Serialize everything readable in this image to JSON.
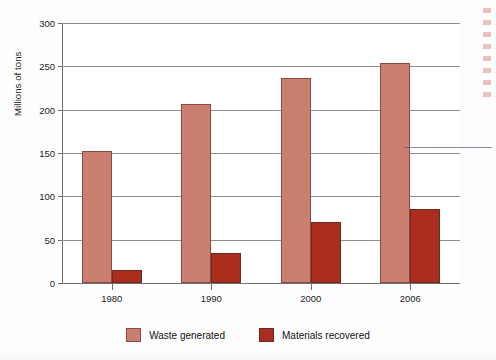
{
  "figure": {
    "background_color": "#fdfdfd",
    "plot_background_color": "#ffffff"
  },
  "axis": {
    "y_title": "Millions of tons",
    "y_ticks": [
      "0",
      "50",
      "100",
      "150",
      "200",
      "250",
      "300"
    ],
    "x_ticks": [
      "1980",
      "1990",
      "2000",
      "2006"
    ]
  },
  "legend": {
    "items": [
      {
        "label": "Waste generated",
        "color": "#cb7f71",
        "swatch_name": "legend-swatch-waste-generated"
      },
      {
        "label": "Materials recovered",
        "color": "#ab2d1d",
        "swatch_name": "legend-swatch-materials-recovered"
      }
    ]
  },
  "colors": {
    "waste_generated": "#cb7f71",
    "materials_recovered": "#ab2d1d",
    "gridline": "#8d8d8d",
    "axis": "#6f6f6f",
    "text": "#1b1b1b",
    "stray_blue_line": "#4a4aa8",
    "margin_artifact_red": "#b02416"
  },
  "chart_data": {
    "type": "bar",
    "title": "",
    "subtitle": "",
    "xlabel": "",
    "ylabel": "Millions of tons",
    "categories": [
      "1980",
      "1990",
      "2000",
      "2006"
    ],
    "series": [
      {
        "name": "Waste generated",
        "color": "#cb7f71",
        "values": [
          152,
          207,
          236,
          254
        ]
      },
      {
        "name": "Materials recovered",
        "color": "#ab2d1d",
        "values": [
          15,
          35,
          70,
          85
        ]
      }
    ],
    "ylim": [
      0,
      300
    ],
    "yticks": [
      0,
      50,
      100,
      150,
      200,
      250,
      300
    ],
    "grid": true,
    "grid_axis": "y",
    "legend_position": "bottom",
    "bar_layout": "grouped",
    "annotations": []
  }
}
